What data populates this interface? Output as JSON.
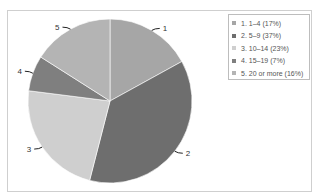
{
  "chart_data": {
    "type": "pie",
    "title": "",
    "categories": [
      "1. 1–4",
      "2. 5–9",
      "3. 10–14",
      "4. 15–19",
      "5. 20 or more"
    ],
    "values": [
      17,
      37,
      23,
      7,
      16
    ],
    "unit": "%",
    "slice_labels": [
      "1",
      "2",
      "3",
      "4",
      "5"
    ],
    "legend": [
      "1. 1–4 (17%)",
      "2. 5–9 (37%)",
      "3. 10–14 (23%)",
      "4. 15–19 (7%)",
      "5. 20 or more (16%)"
    ],
    "legend_position": "right",
    "colors": [
      "#a6a6a6",
      "#6e6e6e",
      "#cfcfcf",
      "#7f7f7f",
      "#b4b4b4"
    ]
  },
  "legend": {
    "items": [
      {
        "label": "1. 1–4 (17%)",
        "color": "#a6a6a6"
      },
      {
        "label": "2. 5–9 (37%)",
        "color": "#6e6e6e"
      },
      {
        "label": "3. 10–14 (23%)",
        "color": "#cfcfcf"
      },
      {
        "label": "4. 15–19 (7%)",
        "color": "#7f7f7f"
      },
      {
        "label": "5. 20 or more (16%)",
        "color": "#b4b4b4"
      }
    ]
  },
  "labels": [
    "1",
    "2",
    "3",
    "4",
    "5"
  ]
}
